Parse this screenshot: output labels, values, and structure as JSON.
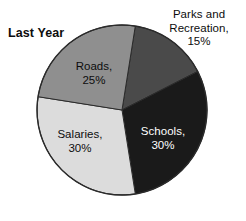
{
  "chart_data": {
    "type": "pie",
    "title": "Last Year",
    "xlabel": "",
    "ylabel": "",
    "legend": "none",
    "grid": false,
    "units": "percent",
    "total": 100,
    "categories": [
      "Parks and Recreation",
      "Schools",
      "Salaries",
      "Roads"
    ],
    "values": [
      15,
      30,
      30,
      25
    ],
    "slices": [
      {
        "name": "Parks and Recreation",
        "value": 15,
        "value_label": "15%",
        "label_lines": [
          "Parks and",
          "Recreation,",
          "15%"
        ],
        "color": "#4a4a4a",
        "text_color": "#0d0d0d",
        "label_position": "outside-top-right",
        "start_angle_deg": 9,
        "end_angle_deg": 63
      },
      {
        "name": "Schools",
        "value": 30,
        "value_label": "30%",
        "label_lines": [
          "Schools,",
          "30%"
        ],
        "color": "#1a1a1a",
        "text_color": "#ffffff",
        "label_position": "inside-right",
        "start_angle_deg": 63,
        "end_angle_deg": 171
      },
      {
        "name": "Salaries",
        "value": 30,
        "value_label": "30%",
        "label_lines": [
          "Salaries,",
          "30%"
        ],
        "color": "#dcdcdc",
        "text_color": "#0d0d0d",
        "label_position": "inside-bottom-left",
        "start_angle_deg": 171,
        "end_angle_deg": 279
      },
      {
        "name": "Roads",
        "value": 25,
        "value_label": "25%",
        "label_lines": [
          "Roads,",
          "25%"
        ],
        "color": "#8f8f8f",
        "text_color": "#0d0d0d",
        "label_position": "inside-upper-left",
        "start_angle_deg": 279,
        "end_angle_deg": 369
      }
    ],
    "geometry": {
      "center_x": 122,
      "center_y": 110,
      "radius": 85,
      "outline_color": "#2b2b2b"
    }
  },
  "labels": {
    "parks_line1": "Parks and",
    "parks_line2": "Recreation,",
    "parks_line3": "15%",
    "roads_line1": "Roads,",
    "roads_line2": "25%",
    "salaries_line1": "Salaries,",
    "salaries_line2": "30%",
    "schools_line1": "Schools,",
    "schools_line2": "30%"
  }
}
